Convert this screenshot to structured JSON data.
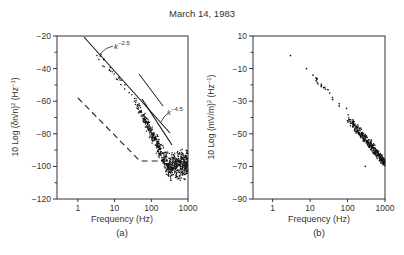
{
  "figure_title": "March 14, 1983",
  "chart_data": [
    {
      "type": "scatter",
      "panel": "(a)",
      "title": "",
      "xlabel": "Frequency (Hz)",
      "ylabel": "10 Log (δn/n)² (Hz⁻¹)",
      "xscale": "log",
      "xlim": [
        0.27,
        1000
      ],
      "ylim": [
        -120,
        -20
      ],
      "xticks": [
        1,
        10,
        100,
        1000
      ],
      "xtick_labels": [
        "1",
        "10",
        "100",
        "1000"
      ],
      "yticks": [
        -20,
        -40,
        -60,
        -80,
        -100,
        -120
      ],
      "ytick_labels": [
        "−20",
        "−40",
        "−60",
        "−80",
        "−100",
        "−120"
      ],
      "grid": false,
      "fit_lines": [
        {
          "label": "k^-2.5",
          "slope_db_per_decade": -25,
          "x": [
            0.6,
            150
          ],
          "y": [
            -20,
            -80
          ]
        },
        {
          "label": "k^-4.5",
          "slope_db_per_decade": -45,
          "x": [
            25,
            200
          ],
          "y": [
            -43,
            -84
          ]
        }
      ],
      "annotations": [
        {
          "text": "k",
          "superscript": "−2.5",
          "near": [
            8,
            -30
          ]
        },
        {
          "text": "k",
          "superscript": "−4.5",
          "near": [
            150,
            -78
          ]
        }
      ],
      "noise_floor_dashed": {
        "x": [
          1,
          60,
          300
        ],
        "y": [
          -59,
          -98,
          -98
        ]
      },
      "scatter_description": "dense cloud of spectral points following power-law decay; ~-25 dB/decade below ~30 Hz, ~-45 dB/decade above, flattening near -100 dB at 300-1000 Hz",
      "sample_points": [
        [
          3,
          -31
        ],
        [
          8,
          -41
        ],
        [
          15,
          -44
        ],
        [
          30,
          -55
        ],
        [
          50,
          -60
        ],
        [
          100,
          -78
        ],
        [
          200,
          -88
        ],
        [
          400,
          -95
        ],
        [
          700,
          -100
        ],
        [
          1000,
          -102
        ]
      ]
    },
    {
      "type": "scatter",
      "panel": "(b)",
      "title": "",
      "xlabel": "Frequency (Hz)",
      "ylabel": "10 Log (mV/m)² (Hz⁻¹)",
      "xscale": "log",
      "xlim": [
        0.3,
        1000
      ],
      "ylim": [
        -90,
        10
      ],
      "xticks": [
        1,
        10,
        100,
        1000
      ],
      "xtick_labels": [
        "1",
        "10",
        "100",
        "1000"
      ],
      "yticks": [
        10,
        -10,
        -30,
        -50,
        -70,
        -90
      ],
      "ytick_labels": [
        "10",
        "−10",
        "−30",
        "−50",
        "−70",
        "−90"
      ],
      "grid": false,
      "scatter_description": "sparse points at low frequency, dense cluster 100-1000 Hz, roughly linear decay in log-log",
      "sample_points": [
        [
          3,
          -2
        ],
        [
          8,
          -10
        ],
        [
          12,
          -14
        ],
        [
          15,
          -16
        ],
        [
          20,
          -21
        ],
        [
          30,
          -23
        ],
        [
          40,
          -29
        ],
        [
          60,
          -33
        ],
        [
          100,
          -42
        ],
        [
          150,
          -47
        ],
        [
          200,
          -52
        ],
        [
          300,
          -58
        ],
        [
          500,
          -62
        ],
        [
          800,
          -66
        ],
        [
          1000,
          -68
        ]
      ]
    }
  ],
  "panels": {
    "a": {
      "ylabel_main": "10 Log (δn/n)",
      "ylabel_sup": "2",
      "ylabel_unit": " (Hz",
      "ylabel_unit_sup": "−1",
      "ylabel_close": ")",
      "xlabel": "Frequency (Hz)",
      "caption": "(a)",
      "k1_base": "k",
      "k1_exp": "−2.5",
      "k2_base": "k",
      "k2_exp": "−4.5"
    },
    "b": {
      "ylabel_main": "10 Log (mV/m)",
      "ylabel_sup": "2",
      "ylabel_unit": " (Hz",
      "ylabel_unit_sup": "−1",
      "ylabel_close": ")",
      "xlabel": "Frequency (Hz)",
      "caption": "(b)"
    }
  },
  "colors": {
    "ink": "#222222",
    "axis": "#333333",
    "background": "#ffffff"
  }
}
